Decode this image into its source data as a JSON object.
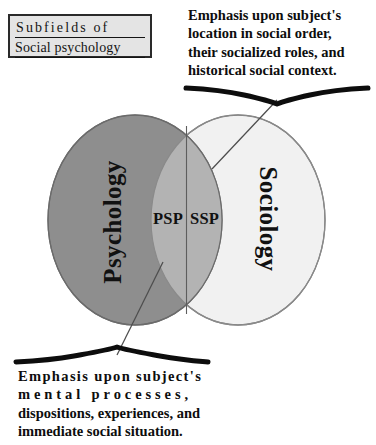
{
  "figure": {
    "title_box": {
      "line_1": "Subfields of",
      "line_2": "Social psychology"
    },
    "diagram_type": "venn",
    "colors": {
      "left_ellipse_fill": "#8e8e8e",
      "right_ellipse_fill": "#f1f1f1",
      "intersection_fill": "#b3b3b3",
      "outline": "#6f6f6f",
      "text": "#111111",
      "title_box_fill": "#e4e4e4",
      "title_box_border": "#2a2a2a",
      "brace": "#0d0d0d",
      "leader_line": "#555555",
      "background": "#ffffff"
    },
    "sets": [
      {
        "id": "psychology",
        "label": "Psychology",
        "rotation_deg": -90,
        "side": "left"
      },
      {
        "id": "sociology",
        "label": "Sociology",
        "rotation_deg": 90,
        "side": "right"
      }
    ],
    "intersection": {
      "left_region": {
        "id": "psp",
        "label": "PSP"
      },
      "right_region": {
        "id": "ssp",
        "label": "SSP"
      }
    },
    "annotations": [
      {
        "id": "top",
        "points_to": "ssp",
        "brace_orientation": "down",
        "lines": [
          "Emphasis upon subject's",
          "location in social order,",
          "their socialized roles, and",
          "historical social context."
        ]
      },
      {
        "id": "bottom",
        "points_to": "psp",
        "brace_orientation": "up",
        "lines": [
          "Emphasis upon subject's",
          "mental processes,",
          "dispositions, experiences, and",
          "immediate social situation."
        ]
      }
    ]
  }
}
